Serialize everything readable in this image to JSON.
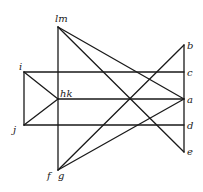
{
  "diagram": {
    "points": {
      "lm": {
        "label": "lm"
      },
      "b": {
        "label": "b"
      },
      "c": {
        "label": "c"
      },
      "a": {
        "label": "a"
      },
      "d": {
        "label": "d"
      },
      "e": {
        "label": "e"
      },
      "i": {
        "label": "i"
      },
      "j": {
        "label": "j"
      },
      "hk": {
        "label": "hk"
      },
      "f": {
        "label": "f"
      },
      "g": {
        "label": "g"
      }
    },
    "segments": [
      [
        "lm",
        "fg"
      ],
      [
        "b",
        "e"
      ],
      [
        "i",
        "c"
      ],
      [
        "j",
        "d"
      ],
      [
        "i",
        "j"
      ],
      [
        "hk",
        "a"
      ],
      [
        "i",
        "hk"
      ],
      [
        "j",
        "hk"
      ],
      [
        "lm",
        "a"
      ],
      [
        "lm",
        "e"
      ],
      [
        "fg",
        "b"
      ],
      [
        "fg",
        "a"
      ]
    ]
  }
}
